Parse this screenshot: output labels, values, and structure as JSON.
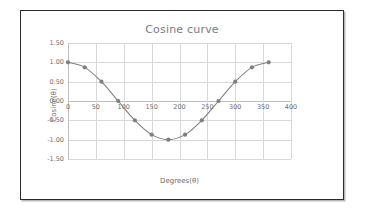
{
  "chart_data": {
    "type": "line",
    "title": "Cosine curve",
    "xlabel": "Degrees(θ)",
    "ylabel": "Cosine(θ)",
    "xlim": [
      0,
      400
    ],
    "ylim": [
      -1.5,
      1.5
    ],
    "grid": true,
    "legend": "none",
    "x_ticks": [
      0,
      50,
      100,
      150,
      200,
      250,
      300,
      350,
      400
    ],
    "x_tick_labels": [
      "0",
      "50",
      "100",
      "150",
      "200",
      "250",
      "300",
      "350",
      "400"
    ],
    "y_ticks": [
      -1.5,
      -1.0,
      -0.5,
      0.0,
      0.5,
      1.0,
      1.5
    ],
    "y_tick_labels": [
      "-1.50",
      "-1.00",
      "-0.50",
      "0.00",
      "0.50",
      "1.00",
      "1.50"
    ],
    "series": [
      {
        "name": "Cosine(θ)",
        "x": [
          0,
          30,
          60,
          90,
          120,
          150,
          180,
          210,
          240,
          270,
          300,
          330,
          360
        ],
        "values": [
          1.0,
          0.87,
          0.5,
          0.0,
          -0.5,
          -0.87,
          -1.0,
          -0.87,
          -0.5,
          0.0,
          0.5,
          0.87,
          1.0
        ],
        "color": "#808080",
        "marker": "circle",
        "marker_color": "#7f7f7f",
        "line_width": 1.1,
        "smooth": true
      }
    ]
  },
  "style": {
    "frame_border_color": "#2b2b2b",
    "plot_background": "#ffffff",
    "gridline_color": "#d8d8d8",
    "axis_color": "#bfbfbf",
    "title_color": "#7b7b7b",
    "tick_label_color": "#6e6e6e"
  }
}
